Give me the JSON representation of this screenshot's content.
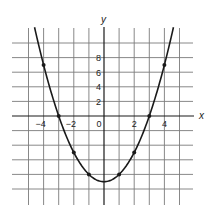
{
  "chart_data": {
    "type": "line",
    "title": "",
    "xlabel": "x",
    "ylabel": "y",
    "x_tick_labels": [
      {
        "value": -4,
        "label": "−4"
      },
      {
        "value": -2,
        "label": "−2"
      },
      {
        "value": 0,
        "label": "0"
      },
      {
        "value": 2,
        "label": "2"
      },
      {
        "value": 4,
        "label": "4"
      }
    ],
    "y_tick_labels": [
      {
        "value": 2,
        "label": "2"
      },
      {
        "value": 4,
        "label": "4"
      },
      {
        "value": 6,
        "label": "6"
      },
      {
        "value": 8,
        "label": "8"
      }
    ],
    "grid": true,
    "grid_x_step": 1,
    "grid_y_step": 2,
    "xlim": [
      -5,
      5
    ],
    "ylim": [
      -12,
      12
    ],
    "curve": {
      "equation": "y = x^2 - 9",
      "x_range": [
        -4.6,
        4.6
      ]
    },
    "series": [
      {
        "name": "plotted points",
        "x": [
          -4,
          -3,
          -2,
          -1,
          1,
          2,
          3,
          4
        ],
        "y": [
          7,
          0,
          -5,
          -8,
          -8,
          -5,
          0,
          7
        ]
      }
    ],
    "colors": {
      "line": "#1a1a1a",
      "grid": "#7a7a7a",
      "axis": "#1a1a1a"
    }
  }
}
